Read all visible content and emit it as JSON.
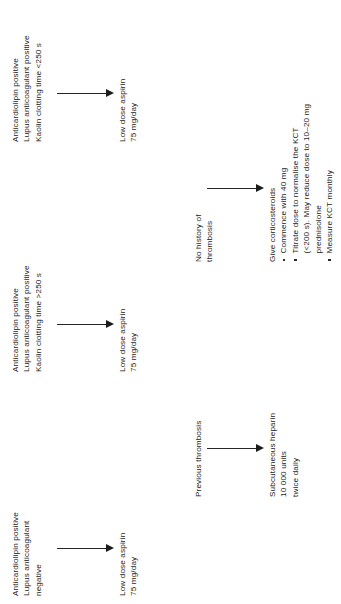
{
  "diagram": {
    "orientation": "rotated-90-ccw",
    "background_color": "#ffffff",
    "text_color": "#232323",
    "arrow_color": "#1c1c1c",
    "nodes": [
      {
        "id": "condition-acl-positive-lac-negative",
        "role": "condition",
        "lines": [
          "Anticardiolipin positive",
          "Lupus anticoagulant",
          "negative"
        ]
      },
      {
        "id": "treatment-aspirin-1",
        "role": "treatment",
        "lines": [
          "Low dose aspirin",
          "75 mg/day"
        ]
      },
      {
        "id": "condition-kct-greater-250",
        "role": "condition",
        "lines": [
          "Anticardiolipin positive",
          "Lupus anticoagulant positive",
          "Kaolin clotting time >250 s"
        ]
      },
      {
        "id": "treatment-aspirin-2",
        "role": "treatment",
        "lines": [
          "Low dose aspirin",
          "75 mg/day"
        ]
      },
      {
        "id": "condition-kct-less-250",
        "role": "condition",
        "lines": [
          "Anticardiolipin positive",
          "Lupus anticoagulant positive",
          "Kaolin clotting time <250 s"
        ]
      },
      {
        "id": "treatment-aspirin-3",
        "role": "treatment",
        "lines": [
          "Low dose aspirin",
          "75 mg/day"
        ]
      },
      {
        "id": "branch-previous-thrombosis",
        "role": "branch",
        "lines": [
          "Previous thrombosis"
        ]
      },
      {
        "id": "treatment-heparin",
        "role": "treatment",
        "lines": [
          "Subcutaneous heparin",
          "10 000 units",
          "twice daily"
        ]
      },
      {
        "id": "branch-no-history-thrombosis",
        "role": "branch",
        "lines": [
          "No history of",
          "thrombosis"
        ]
      },
      {
        "id": "treatment-corticosteroids",
        "role": "treatment",
        "heading": "Give corticosteroids",
        "bullets": [
          {
            "lines": [
              "Commence with 40 mg"
            ]
          },
          {
            "lines": [
              "Titrate dose to normalise the KCT",
              "(<200 s). May reduce dose to 10–20 mg",
              "prednisolone"
            ]
          },
          {
            "lines": [
              "Measure KCT monthly"
            ]
          }
        ]
      }
    ],
    "arrows": [
      {
        "id": "arrow-acl-neg-to-aspirin",
        "from": "condition-acl-positive-lac-negative",
        "to": "treatment-aspirin-1"
      },
      {
        "id": "arrow-kct-gt250-to-aspirin",
        "from": "condition-kct-greater-250",
        "to": "treatment-aspirin-2"
      },
      {
        "id": "arrow-kct-lt250-to-aspirin",
        "from": "condition-kct-less-250",
        "to": "treatment-aspirin-3"
      },
      {
        "id": "arrow-prev-thrombosis-to-heparin",
        "from": "branch-previous-thrombosis",
        "to": "treatment-heparin"
      },
      {
        "id": "arrow-no-history-to-corticosteroids",
        "from": "branch-no-history-thrombosis",
        "to": "treatment-corticosteroids"
      }
    ]
  }
}
